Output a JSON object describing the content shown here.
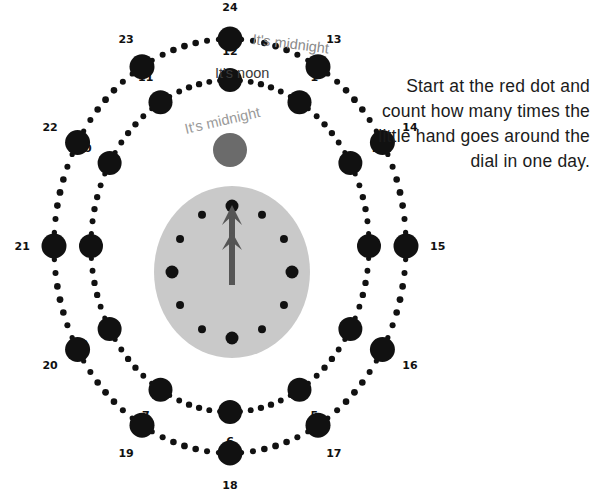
{
  "canvas": {
    "width": 599,
    "height": 494,
    "background": "#ffffff"
  },
  "instruction": {
    "text": "Start at the red dot and count how many times the little hand goes around the dial in one day."
  },
  "callouts": {
    "midnight_top": "It's midnight",
    "noon": "It's noon",
    "midnight_inner": "It's midnight"
  },
  "colors": {
    "dot": "#111111",
    "clock_face": "#c9c9c9",
    "clock_hand": "#555555",
    "start_dot": "#6b6b6b",
    "label": "#111111",
    "callout_gray": "#8a8a8a"
  },
  "inner_ring": {
    "name": "hours-1-to-12",
    "center": [
      230,
      246
    ],
    "radius_x": 139,
    "radius_y": 166,
    "start_angle_deg": -90,
    "node_radius": 12,
    "bead_radius": 3.2,
    "beads_between": 6,
    "label_offset": 20,
    "labels": [
      "12",
      "1",
      "2",
      "3",
      "4",
      "5",
      "6",
      "7",
      "8",
      "9",
      "10",
      "11"
    ]
  },
  "outer_ring": {
    "name": "hours-13-to-24",
    "center": [
      230,
      246
    ],
    "radius_x": 176,
    "radius_y": 207,
    "start_angle_deg": -90,
    "node_radius": 12.5,
    "bead_radius": 3.4,
    "beads_between": 7,
    "label_offset": 22,
    "labels": [
      "24",
      "13",
      "14",
      "15",
      "16",
      "17",
      "18",
      "19",
      "20",
      "21",
      "22",
      "23"
    ]
  },
  "clock_face": {
    "name": "clock-dial",
    "center": [
      232,
      272
    ],
    "radius_x": 78,
    "radius_y": 86,
    "marks": [
      {
        "hour": 12,
        "size": "large"
      },
      {
        "hour": 1,
        "size": "small"
      },
      {
        "hour": 2,
        "size": "small"
      },
      {
        "hour": 3,
        "size": "large"
      },
      {
        "hour": 4,
        "size": "small"
      },
      {
        "hour": 5,
        "size": "small"
      },
      {
        "hour": 6,
        "size": "large"
      },
      {
        "hour": 7,
        "size": "small"
      },
      {
        "hour": 8,
        "size": "small"
      },
      {
        "hour": 9,
        "size": "large"
      },
      {
        "hour": 10,
        "size": "small"
      },
      {
        "hour": 11,
        "size": "small"
      }
    ],
    "mark_radius_large": 6.5,
    "mark_radius_small": 4,
    "mark_ring_rx": 60,
    "mark_ring_ry": 66,
    "hands": {
      "minute": {
        "from": [
          232,
          285
        ],
        "to": [
          232,
          205
        ]
      },
      "hour": {
        "from": [
          232,
          285
        ],
        "to": [
          232,
          232
        ]
      }
    }
  },
  "start_dot": {
    "name": "start-marker",
    "center": [
      230,
      150
    ],
    "radius": 17
  },
  "callout_positions": {
    "midnight_top": {
      "x": 252,
      "y": 44,
      "rotate": 7
    },
    "noon": {
      "x": 215,
      "y": 78,
      "rotate": 0
    },
    "midnight_inner": {
      "x": 186,
      "y": 134,
      "rotate": -13
    }
  }
}
